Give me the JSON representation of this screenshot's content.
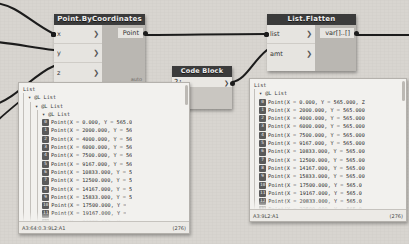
{
  "app": {
    "background_color": "#d8d5d0"
  },
  "nodes": [
    {
      "id": "point-bycoordinates",
      "title": "Point.ByCoordinates",
      "inputs": [
        {
          "label": "x",
          "chevron": "❯"
        },
        {
          "label": "y",
          "chevron": "❯"
        },
        {
          "label": "z",
          "chevron": "❯"
        }
      ],
      "output": "Point",
      "run_mode": "auto"
    },
    {
      "id": "list-flatten",
      "title": "List.Flatten",
      "inputs": [
        {
          "label": "list",
          "chevron": "❯"
        },
        {
          "label": "amt",
          "chevron": "❯"
        }
      ],
      "output": "var[]..[]",
      "run_mode": ""
    },
    {
      "id": "code-block",
      "title": "Code Block",
      "code": "2;",
      "output": "❯"
    }
  ],
  "left_panel": {
    "root_label": "List",
    "level_labels": [
      "▾ @L List",
      "▾ @L List",
      "▾ @L List"
    ],
    "items": [
      {
        "index": "0",
        "value": "Point(X = 0.000, Y = 565.0"
      },
      {
        "index": "1",
        "value": "Point(X = 2000.000, Y = 56"
      },
      {
        "index": "2",
        "value": "Point(X = 4000.000, Y = 56"
      },
      {
        "index": "3",
        "value": "Point(X = 6000.000, Y = 56"
      },
      {
        "index": "4",
        "value": "Point(X = 7500.000, Y = 56"
      },
      {
        "index": "5",
        "value": "Point(X = 9167.000, Y = 56"
      },
      {
        "index": "6",
        "value": "Point(X = 10833.000, Y = 5"
      },
      {
        "index": "7",
        "value": "Point(X = 12500.000, Y = 5"
      },
      {
        "index": "8",
        "value": "Point(X = 14167.000, Y = 5"
      },
      {
        "index": "9",
        "value": "Point(X = 15833.000, Y = 5"
      },
      {
        "index": "10",
        "value": "Point(X = 17500.000, Y ="
      },
      {
        "index": "11",
        "value": "Point(X = 19167.000, Y ="
      },
      {
        "index": "12",
        "value": "Point(X = 20833.000, Y ="
      }
    ],
    "footer_left": "A3:64:0.3:9L2:A1",
    "footer_right": "(276)"
  },
  "right_panel": {
    "root_label": "List",
    "level_labels": [
      "▾ @L List"
    ],
    "items": [
      {
        "index": "0",
        "value": "Point(X = 0.000, Y = 565.000, Z"
      },
      {
        "index": "1",
        "value": "Point(X = 2000.000, Y = 565.000"
      },
      {
        "index": "2",
        "value": "Point(X = 4000.000, Y = 565.000"
      },
      {
        "index": "3",
        "value": "Point(X = 6000.000, Y = 565.000"
      },
      {
        "index": "4",
        "value": "Point(X = 7500.000, Y = 565.000"
      },
      {
        "index": "5",
        "value": "Point(X = 9167.000, Y = 565.000"
      },
      {
        "index": "6",
        "value": "Point(X = 10833.000, Y = 565.00"
      },
      {
        "index": "7",
        "value": "Point(X = 12500.000, Y = 565.00"
      },
      {
        "index": "8",
        "value": "Point(X = 14167.000, Y = 565.00"
      },
      {
        "index": "9",
        "value": "Point(X = 15833.000, Y = 565.00"
      },
      {
        "index": "10",
        "value": "Point(X = 17500.000, Y = 565.0"
      },
      {
        "index": "11",
        "value": "Point(X = 19167.000, Y = 565.0"
      },
      {
        "index": "12",
        "value": "Point(X = 20833.000, Y = 565.0"
      },
      {
        "index": "13",
        "value": "Point(X = 22500.000, Y = 565.0"
      }
    ],
    "footer_left": "A3:9L2:A1",
    "footer_right": "(276)"
  }
}
